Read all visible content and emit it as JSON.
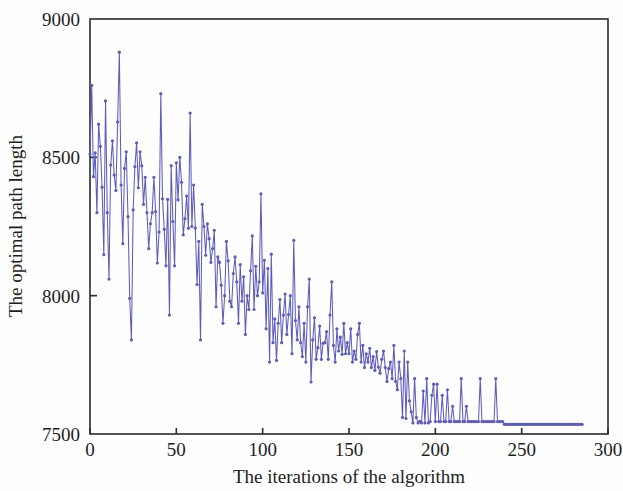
{
  "figure": {
    "background_color": "#fefefe",
    "axis_color": "#2b2b2b",
    "text_color": "#1d1d1d"
  },
  "chart_data": {
    "type": "line",
    "title": "",
    "xlabel": "The iterations of the algorithm",
    "ylabel": "The optimal path length",
    "xlim": [
      0,
      300
    ],
    "ylim": [
      7500,
      9000
    ],
    "xticks": [
      0,
      50,
      100,
      150,
      200,
      250,
      300
    ],
    "xtick_labels": [
      "0",
      "50",
      "100",
      "150",
      "200",
      "250",
      "300"
    ],
    "yticks": [
      7500,
      8000,
      8500,
      9000
    ],
    "ytick_labels": [
      "7500",
      "8000",
      "8500",
      "9000"
    ],
    "grid": false,
    "legend": null,
    "series": [
      {
        "name": "optimal path length",
        "color": "#5c5cbe",
        "marker": "dot",
        "marker_size": 1.6,
        "line_width": 1.05,
        "x_start": 0,
        "x_step": 1,
        "values": [
          8512,
          8760,
          8430,
          8516,
          8300,
          8620,
          8540,
          8392,
          8148,
          8704,
          8300,
          8060,
          8472,
          8560,
          8436,
          8380,
          8628,
          8880,
          8400,
          8188,
          8460,
          8520,
          8286,
          7990,
          7840,
          8310,
          8466,
          8552,
          8390,
          8520,
          8470,
          8330,
          8428,
          8300,
          8170,
          8260,
          8300,
          8428,
          8304,
          8118,
          8230,
          8730,
          8350,
          8240,
          8108,
          8348,
          7930,
          8470,
          8268,
          8108,
          8480,
          8346,
          8500,
          8410,
          8220,
          8278,
          8360,
          8244,
          8660,
          8250,
          8400,
          8244,
          8040,
          8196,
          7840,
          8330,
          8250,
          8146,
          8260,
          8206,
          8120,
          8170,
          8236,
          7960,
          8140,
          8120,
          8038,
          7900,
          8000,
          8196,
          8126,
          7980,
          7960,
          8080,
          8140,
          8050,
          7900,
          8112,
          7980,
          8068,
          7860,
          8000,
          7950,
          8090,
          8216,
          7950,
          8106,
          8000,
          8050,
          8368,
          8010,
          8128,
          7880,
          8098,
          7760,
          8150,
          7830,
          7916,
          7766,
          7900,
          7986,
          7830,
          7930,
          8006,
          7860,
          7932,
          8000,
          7790,
          8200,
          7910,
          7840,
          7960,
          7830,
          7780,
          7900,
          7760,
          7960,
          8060,
          7688,
          7840,
          7920,
          7770,
          7812,
          7890,
          7770,
          7828,
          7830,
          7870,
          7770,
          7930,
          8050,
          7820,
          7760,
          7880,
          7800,
          7850,
          7788,
          7900,
          7790,
          7830,
          7790,
          7880,
          7760,
          7800,
          7770,
          7860,
          7900,
          7760,
          7820,
          7740,
          7790,
          7760,
          7810,
          7740,
          7780,
          7730,
          7798,
          7742,
          7720,
          7770,
          7800,
          7740,
          7690,
          7736,
          7760,
          7700,
          7820,
          7690,
          7660,
          7760,
          7700,
          7560,
          7800,
          7556,
          7760,
          7620,
          7580,
          7540,
          7700,
          7560,
          7540,
          7546,
          7540,
          7655,
          7540,
          7700,
          7540,
          7545,
          7640,
          7680,
          7545,
          7680,
          7545,
          7545,
          7640,
          7545,
          7545,
          7660,
          7545,
          7545,
          7600,
          7545,
          7545,
          7545,
          7545,
          7700,
          7545,
          7545,
          7600,
          7545,
          7545,
          7545,
          7545,
          7545,
          7545,
          7545,
          7700,
          7545,
          7545,
          7545,
          7545,
          7545,
          7545,
          7545,
          7545,
          7700,
          7545,
          7545,
          7545,
          7545,
          7535,
          7535,
          7535,
          7535,
          7535,
          7535,
          7535,
          7535,
          7535,
          7535,
          7535,
          7535,
          7535,
          7535,
          7535,
          7535,
          7535,
          7535,
          7535,
          7535,
          7535,
          7535,
          7535,
          7535,
          7535,
          7535,
          7535,
          7535,
          7535,
          7535,
          7535,
          7535,
          7535,
          7535,
          7535,
          7535,
          7535,
          7535,
          7535,
          7535,
          7535,
          7535,
          7535,
          7535,
          7535,
          7535
        ]
      }
    ]
  }
}
